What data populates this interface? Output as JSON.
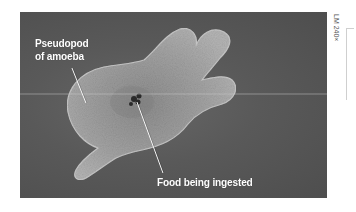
{
  "figure": {
    "labels": {
      "pseudopod_line1": "Pseudopod",
      "pseudopod_line2": "of amoeba",
      "food": "Food being ingested"
    },
    "magnification": "LM 240×",
    "colors": {
      "background": "#555555",
      "cell": "#9a9a9a",
      "label_text": "#ffffff"
    }
  }
}
